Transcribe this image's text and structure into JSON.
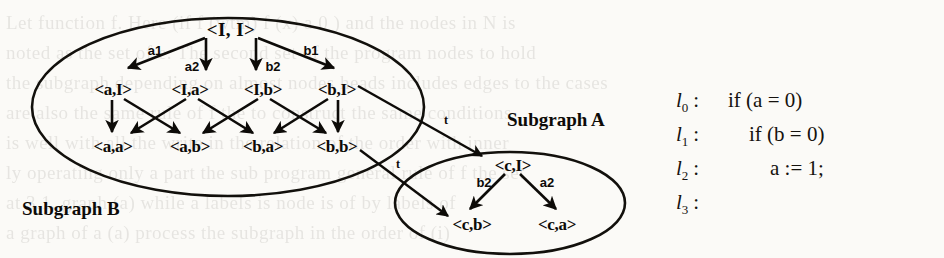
{
  "figure": {
    "regions": [
      {
        "name": "subgraph-b",
        "label": "Subgraph B"
      },
      {
        "name": "subgraph-a",
        "label": "Subgraph A"
      }
    ],
    "nodes": [
      {
        "id": "root",
        "label": "<I, I>"
      },
      {
        "id": "n_aI",
        "label": "<a,I>"
      },
      {
        "id": "n_Ia",
        "label": "<I,a>"
      },
      {
        "id": "n_Ib",
        "label": "<I,b>"
      },
      {
        "id": "n_bI",
        "label": "<b,I>"
      },
      {
        "id": "n_aa",
        "label": "<a,a>"
      },
      {
        "id": "n_ab",
        "label": "<a,b>"
      },
      {
        "id": "n_ba",
        "label": "<b,a>"
      },
      {
        "id": "n_bb",
        "label": "<b,b>"
      },
      {
        "id": "n_cI",
        "label": "<c,I>"
      },
      {
        "id": "n_cb",
        "label": "<c,b>"
      },
      {
        "id": "n_ca",
        "label": "<c,a>"
      }
    ],
    "edge_labels": {
      "a1": "a1",
      "a2": "a2",
      "b2": "b2",
      "b1": "b1",
      "t_upper": "t",
      "t_lower": "t",
      "cI_b2": "b2",
      "cI_a2": "a2"
    }
  },
  "code": {
    "lines": [
      {
        "label": "l",
        "sub": "0",
        "text": "if (a = 0)"
      },
      {
        "label": "l",
        "sub": "1",
        "text": "    if (b = 0)"
      },
      {
        "label": "l",
        "sub": "2",
        "text": "        a := 1;"
      },
      {
        "label": "l",
        "sub": "3",
        "text": ""
      }
    ]
  },
  "ghost_text": [
    {
      "x": 6,
      "y": 12,
      "text": "Let  function  f.  Here  (if  f  (wtm)  f  (x)  a  0  )  and  the  nodes  in  N  is"
    },
    {
      "x": 6,
      "y": 42,
      "text": "noted as the set  of  e.  The  second  set  of  the  program  nodes  to  hold"
    },
    {
      "x": 6,
      "y": 72,
      "text": "the  subgraph  depending  on  almost  nodes  heads  includes  edges  to  the  cases"
    },
    {
      "x": 6,
      "y": 102,
      "text": "are  also  the  same  rule  of   f  the  to  construct  the  same  conditions"
    },
    {
      "x": 6,
      "y": 132,
      "text": "is  well  with  all  the  write  in  the  relation  of  the  order  with  inner"
    },
    {
      "x": 6,
      "y": 162,
      "text": "ly  operating  only  a  part  the  sub  program  general  rule  of  f  the  set"
    },
    {
      "x": 6,
      "y": 192,
      "text": "at  3.1.  graph  (a)  while  a  labels  is  node  is  of  by  labels  of"
    },
    {
      "x": 6,
      "y": 222,
      "text": "a  graph  of  a  (a)  process  the  subgraph  in  the  order  of  (i)"
    }
  ]
}
